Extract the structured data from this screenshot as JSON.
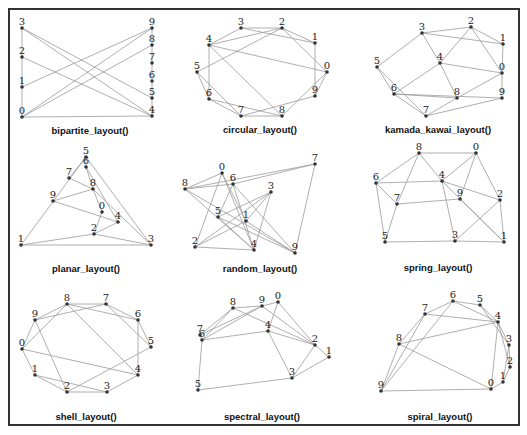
{
  "figure": {
    "panels": [
      {
        "id": "bipartite",
        "caption": "bipartite_layout()",
        "caption_pos": [
          90,
          134
        ],
        "nodes": {
          "0": [
            22,
            117
          ],
          "1": [
            22,
            87
          ],
          "2": [
            22,
            57
          ],
          "3": [
            22,
            28
          ],
          "4": [
            152,
            116
          ],
          "5": [
            152,
            98
          ],
          "6": [
            152,
            81
          ],
          "7": [
            152,
            63
          ],
          "8": [
            152,
            45
          ],
          "9": [
            152,
            28
          ]
        },
        "label_offsets": "above",
        "edges": [
          [
            "3",
            "0"
          ],
          [
            "3",
            "4"
          ],
          [
            "3",
            "5"
          ],
          [
            "2",
            "4"
          ],
          [
            "1",
            "9"
          ],
          [
            "0",
            "9"
          ],
          [
            "0",
            "8"
          ],
          [
            "0",
            "4"
          ],
          [
            "9",
            "4"
          ]
        ]
      },
      {
        "id": "circular",
        "caption": "circular_layout()",
        "caption_pos": [
          260,
          133
        ],
        "nodes": {
          "0": [
            327,
            72
          ],
          "1": [
            315,
            43
          ],
          "2": [
            282,
            28
          ],
          "3": [
            241,
            28
          ],
          "4": [
            209,
            45
          ],
          "5": [
            197,
            72
          ],
          "6": [
            209,
            99
          ],
          "7": [
            241,
            116
          ],
          "8": [
            282,
            116
          ],
          "9": [
            315,
            96
          ]
        },
        "label_offsets": "above",
        "edges": [
          [
            "4",
            "3"
          ],
          [
            "4",
            "2"
          ],
          [
            "4",
            "0"
          ],
          [
            "4",
            "8"
          ],
          [
            "4",
            "6"
          ],
          [
            "3",
            "1"
          ],
          [
            "3",
            "2"
          ],
          [
            "2",
            "1"
          ],
          [
            "2",
            "0"
          ],
          [
            "5",
            "2"
          ],
          [
            "5",
            "6"
          ],
          [
            "5",
            "7"
          ],
          [
            "6",
            "8"
          ],
          [
            "7",
            "9"
          ],
          [
            "7",
            "8"
          ],
          [
            "8",
            "0"
          ],
          [
            "9",
            "0"
          ],
          [
            "1",
            "9"
          ],
          [
            "6",
            "7"
          ]
        ]
      },
      {
        "id": "kamada_kawai",
        "caption": "kamada_kawai_layout()",
        "caption_pos": [
          438,
          133
        ],
        "nodes": {
          "0": [
            502,
            73
          ],
          "1": [
            503,
            44
          ],
          "2": [
            471,
            27
          ],
          "3": [
            422,
            33
          ],
          "4": [
            440,
            63
          ],
          "5": [
            377,
            67
          ],
          "6": [
            394,
            94
          ],
          "7": [
            426,
            116
          ],
          "8": [
            457,
            98
          ],
          "9": [
            502,
            98
          ]
        },
        "label_offsets": "above",
        "edges": [
          [
            "3",
            "2"
          ],
          [
            "3",
            "1"
          ],
          [
            "3",
            "5"
          ],
          [
            "3",
            "4"
          ],
          [
            "2",
            "1"
          ],
          [
            "2",
            "4"
          ],
          [
            "2",
            "0"
          ],
          [
            "1",
            "0"
          ],
          [
            "4",
            "0"
          ],
          [
            "4",
            "6"
          ],
          [
            "4",
            "8"
          ],
          [
            "5",
            "6"
          ],
          [
            "5",
            "7"
          ],
          [
            "6",
            "8"
          ],
          [
            "6",
            "7"
          ],
          [
            "0",
            "9"
          ],
          [
            "0",
            "8"
          ],
          [
            "9",
            "7"
          ],
          [
            "8",
            "7"
          ],
          [
            "6",
            "9"
          ]
        ]
      },
      {
        "id": "planar",
        "caption": "planar_layout()",
        "caption_pos": [
          86,
          272
        ],
        "nodes": {
          "0": [
            102,
            212
          ],
          "1": [
            21,
            245
          ],
          "2": [
            94,
            234
          ],
          "3": [
            151,
            245
          ],
          "4": [
            118,
            222
          ],
          "5": [
            86,
            157
          ],
          "6": [
            86,
            167
          ],
          "7": [
            69,
            178
          ],
          "8": [
            93,
            189
          ],
          "9": [
            53,
            201
          ]
        },
        "label_offsets": "above",
        "edges": [
          [
            "5",
            "1"
          ],
          [
            "5",
            "3"
          ],
          [
            "5",
            "7"
          ],
          [
            "5",
            "6"
          ],
          [
            "6",
            "8"
          ],
          [
            "6",
            "4"
          ],
          [
            "7",
            "8"
          ],
          [
            "9",
            "8"
          ],
          [
            "9",
            "4"
          ],
          [
            "8",
            "3"
          ],
          [
            "0",
            "2"
          ],
          [
            "4",
            "2"
          ],
          [
            "2",
            "1"
          ],
          [
            "2",
            "3"
          ],
          [
            "1",
            "3"
          ],
          [
            "0",
            "8"
          ]
        ]
      },
      {
        "id": "random",
        "caption": "random_layout()",
        "caption_pos": [
          260,
          272
        ],
        "nodes": {
          "0": [
            222,
            173
          ],
          "1": [
            246,
            221
          ],
          "2": [
            195,
            247
          ],
          "3": [
            271,
            192
          ],
          "4": [
            254,
            250
          ],
          "5": [
            218,
            217
          ],
          "6": [
            233,
            184
          ],
          "7": [
            315,
            164
          ],
          "8": [
            185,
            189
          ],
          "9": [
            295,
            253
          ]
        },
        "label_offsets": "above",
        "edges": [
          [
            "8",
            "0"
          ],
          [
            "8",
            "7"
          ],
          [
            "8",
            "6"
          ],
          [
            "8",
            "4"
          ],
          [
            "8",
            "9"
          ],
          [
            "0",
            "2"
          ],
          [
            "0",
            "4"
          ],
          [
            "0",
            "1"
          ],
          [
            "6",
            "7"
          ],
          [
            "6",
            "5"
          ],
          [
            "6",
            "4"
          ],
          [
            "6",
            "9"
          ],
          [
            "3",
            "5"
          ],
          [
            "3",
            "2"
          ],
          [
            "3",
            "4"
          ],
          [
            "3",
            "1"
          ],
          [
            "5",
            "9"
          ],
          [
            "5",
            "4"
          ],
          [
            "1",
            "2"
          ],
          [
            "2",
            "4"
          ],
          [
            "7",
            "9"
          ],
          [
            "1",
            "9"
          ]
        ]
      },
      {
        "id": "spring",
        "caption": "spring_layout()",
        "caption_pos": [
          438,
          271
        ],
        "nodes": {
          "0": [
            476,
            153
          ],
          "1": [
            504,
            242
          ],
          "2": [
            500,
            200
          ],
          "3": [
            455,
            241
          ],
          "4": [
            442,
            181
          ],
          "5": [
            385,
            242
          ],
          "6": [
            376,
            183
          ],
          "7": [
            397,
            204
          ],
          "8": [
            419,
            153
          ],
          "9": [
            460,
            199
          ]
        },
        "label_offsets": "above",
        "edges": [
          [
            "8",
            "0"
          ],
          [
            "8",
            "6"
          ],
          [
            "8",
            "4"
          ],
          [
            "8",
            "7"
          ],
          [
            "0",
            "4"
          ],
          [
            "0",
            "9"
          ],
          [
            "0",
            "2"
          ],
          [
            "6",
            "4"
          ],
          [
            "6",
            "7"
          ],
          [
            "6",
            "5"
          ],
          [
            "4",
            "2"
          ],
          [
            "4",
            "3"
          ],
          [
            "4",
            "1"
          ],
          [
            "7",
            "9"
          ],
          [
            "7",
            "5"
          ],
          [
            "9",
            "1"
          ],
          [
            "2",
            "3"
          ],
          [
            "2",
            "1"
          ],
          [
            "5",
            "3"
          ],
          [
            "3",
            "1"
          ]
        ]
      },
      {
        "id": "shell",
        "caption": "shell_layout()",
        "caption_pos": [
          86,
          420
        ],
        "nodes": {
          "0": [
            22,
            349
          ],
          "1": [
            35,
            375
          ],
          "2": [
            67,
            392
          ],
          "3": [
            107,
            392
          ],
          "4": [
            138,
            375
          ],
          "5": [
            151,
            347
          ],
          "6": [
            138,
            320
          ],
          "7": [
            106,
            304
          ],
          "8": [
            67,
            304
          ],
          "9": [
            35,
            320
          ]
        },
        "label_offsets": "above",
        "edges": [
          [
            "8",
            "7"
          ],
          [
            "8",
            "9"
          ],
          [
            "8",
            "6"
          ],
          [
            "8",
            "4"
          ],
          [
            "7",
            "9"
          ],
          [
            "7",
            "6"
          ],
          [
            "7",
            "5"
          ],
          [
            "9",
            "0"
          ],
          [
            "9",
            "2"
          ],
          [
            "0",
            "8"
          ],
          [
            "0",
            "4"
          ],
          [
            "6",
            "4"
          ],
          [
            "6",
            "5"
          ],
          [
            "1",
            "2"
          ],
          [
            "1",
            "3"
          ],
          [
            "2",
            "3"
          ],
          [
            "2",
            "5"
          ],
          [
            "3",
            "4"
          ],
          [
            "1",
            "0"
          ]
        ]
      },
      {
        "id": "spectral",
        "caption": "spectral_layout()",
        "caption_pos": [
          262,
          420
        ],
        "nodes": {
          "0": [
            278,
            302
          ],
          "1": [
            329,
            357
          ],
          "2": [
            315,
            345
          ],
          "3": [
            292,
            378
          ],
          "4": [
            268,
            331
          ],
          "5": [
            198,
            390
          ],
          "6": [
            202,
            340
          ],
          "7": [
            200,
            335
          ],
          "8": [
            233,
            308
          ],
          "9": [
            262,
            306
          ]
        },
        "label_offsets": "above",
        "edges": [
          [
            "8",
            "9"
          ],
          [
            "8",
            "7"
          ],
          [
            "8",
            "6"
          ],
          [
            "8",
            "2"
          ],
          [
            "9",
            "0"
          ],
          [
            "9",
            "7"
          ],
          [
            "9",
            "6"
          ],
          [
            "9",
            "2"
          ],
          [
            "0",
            "4"
          ],
          [
            "0",
            "2"
          ],
          [
            "6",
            "4"
          ],
          [
            "4",
            "2"
          ],
          [
            "4",
            "3"
          ],
          [
            "2",
            "1"
          ],
          [
            "2",
            "3"
          ],
          [
            "1",
            "3"
          ],
          [
            "3",
            "5"
          ],
          [
            "6",
            "5"
          ],
          [
            "7",
            "6"
          ]
        ]
      },
      {
        "id": "spiral",
        "caption": "spiral_layout()",
        "caption_pos": [
          440,
          420
        ],
        "nodes": {
          "0": [
            491,
            389
          ],
          "1": [
            503,
            382
          ],
          "2": [
            510,
            367
          ],
          "3": [
            509,
            345
          ],
          "4": [
            498,
            322
          ],
          "5": [
            480,
            305
          ],
          "6": [
            453,
            301
          ],
          "7": [
            425,
            314
          ],
          "8": [
            399,
            344
          ],
          "9": [
            381,
            391
          ]
        },
        "label_offsets": "above",
        "edges": [
          [
            "6",
            "5"
          ],
          [
            "6",
            "7"
          ],
          [
            "6",
            "4"
          ],
          [
            "6",
            "9"
          ],
          [
            "5",
            "4"
          ],
          [
            "5",
            "3"
          ],
          [
            "7",
            "8"
          ],
          [
            "7",
            "9"
          ],
          [
            "4",
            "8"
          ],
          [
            "4",
            "3"
          ],
          [
            "4",
            "2"
          ],
          [
            "4",
            "0"
          ],
          [
            "3",
            "2"
          ],
          [
            "3",
            "1"
          ],
          [
            "2",
            "1"
          ],
          [
            "8",
            "9"
          ],
          [
            "8",
            "0"
          ],
          [
            "9",
            "0"
          ],
          [
            "0",
            "1"
          ],
          [
            "7",
            "4"
          ]
        ]
      }
    ]
  }
}
